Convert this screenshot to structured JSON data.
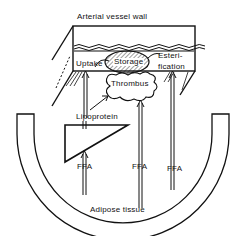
{
  "diagram": {
    "title": "Arterial vessel wall",
    "compartments": {
      "uptake": "Uptake",
      "storage": "Storage",
      "esterification_line1": "Esteri-",
      "esterification_line2": "fication"
    },
    "thrombus": "Thrombus",
    "lipoprotein": "Lipoprotein",
    "ffa_labels": [
      "FFA",
      "FFA",
      "FFA"
    ],
    "adipose": "Adipose tissue",
    "colors": {
      "stroke": "#111111",
      "background": "#ffffff"
    }
  }
}
